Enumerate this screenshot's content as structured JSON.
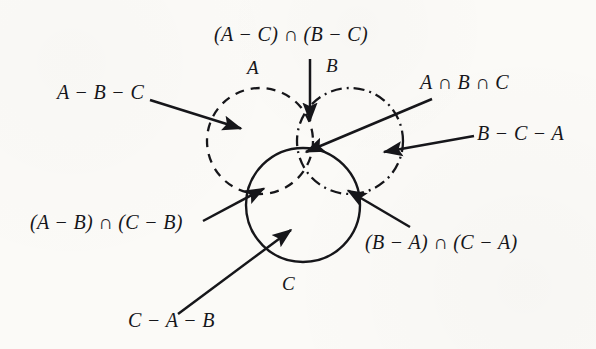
{
  "figure": {
    "type": "venn-diagram",
    "set_count": 3,
    "background_color": "#fbfaf7",
    "ink_color": "#16161a"
  },
  "circles": {
    "a": {
      "name": "A",
      "label": "A",
      "stroke_style": "dashed",
      "cx": 260,
      "cy": 141,
      "r": 53
    },
    "b": {
      "name": "B",
      "label": "B",
      "stroke_style": "dash-dot",
      "cx": 350,
      "cy": 141,
      "r": 53
    },
    "c": {
      "name": "C",
      "label": "C",
      "stroke_style": "solid",
      "cx": 303,
      "cy": 205,
      "r": 57
    }
  },
  "labels": {
    "top_center": "(A − C) ∩ (B − C)",
    "set_a": "A",
    "set_b": "B",
    "set_c": "C",
    "left_upper": "A − B − C",
    "right_upper": "A ∩ B ∩ C",
    "right_middle": "B − C − A",
    "left_lower": "(A − B) ∩ (C − B)",
    "right_lower": "(B − A) ∩ (C − A)",
    "bottom_left": "C − A − B"
  },
  "annotations": [
    {
      "id": "a-only",
      "label": "A − B − C",
      "points_to": "region-A-only",
      "arrow_from": [
        150,
        100
      ],
      "arrow_to": [
        243,
        129
      ]
    },
    {
      "id": "a-b-not-c",
      "label": "(A − C) ∩ (B − C)",
      "points_to": "region-A-and-B-not-C",
      "arrow_from": [
        310,
        59
      ],
      "arrow_to": [
        310,
        124
      ]
    },
    {
      "id": "a-b-c",
      "label": "A ∩ B ∩ C",
      "points_to": "region-A-and-B-and-C",
      "arrow_from": [
        430,
        100
      ],
      "arrow_to": [
        304,
        153
      ]
    },
    {
      "id": "b-only",
      "label": "B − C − A",
      "points_to": "region-B-only",
      "arrow_from": [
        474,
        136
      ],
      "arrow_to": [
        381,
        153
      ]
    },
    {
      "id": "a-c-not-b",
      "label": "(A − B) ∩ (C − B)",
      "points_to": "region-A-and-C-not-B",
      "arrow_from": [
        206,
        219
      ],
      "arrow_to": [
        266,
        187
      ]
    },
    {
      "id": "b-c-not-a",
      "label": "(B − A) ∩ (C − A)",
      "points_to": "region-B-and-C-not-A",
      "arrow_from": [
        408,
        226
      ],
      "arrow_to": [
        346,
        189
      ]
    },
    {
      "id": "c-only",
      "label": "C − A − B",
      "points_to": "region-C-only",
      "arrow_from": [
        180,
        313
      ],
      "arrow_to": [
        294,
        228
      ]
    }
  ]
}
